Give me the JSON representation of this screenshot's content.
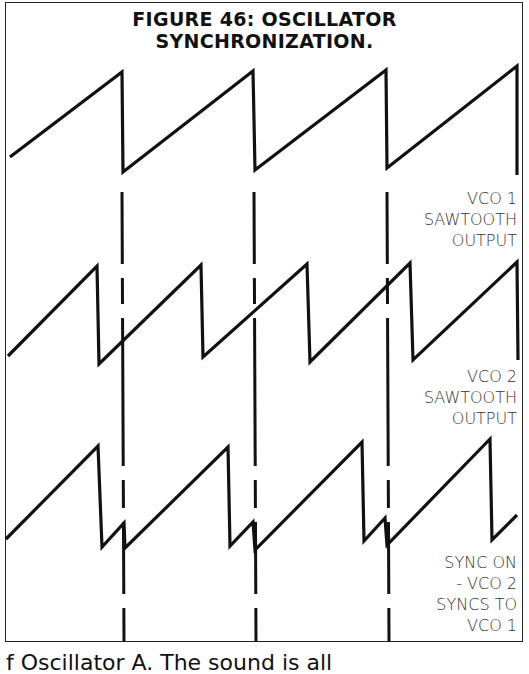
{
  "figure": {
    "title_line1": "FIGURE 46: OSCILLATOR",
    "title_line2": "SYNCHRONIZATION.",
    "labels": {
      "vco1": [
        "VCO 1",
        "SAWTOOTH",
        "OUTPUT"
      ],
      "vco2": [
        "VCO 2",
        "SAWTOOTH",
        "OUTPUT"
      ],
      "sync": [
        "SYNC ON",
        "- VCO 2",
        "SYNCS TO",
        "VCO 1"
      ]
    },
    "caption_fragment": "f Oscillator A. The sound is all"
  },
  "chart_data": {
    "type": "line",
    "title": "FIGURE 46: OSCILLATOR SYNCHRONIZATION.",
    "xlabel": "",
    "ylabel": "",
    "grid": false,
    "legend_position": "right (inline labels)",
    "series": [
      {
        "name": "VCO 1 SAWTOOTH OUTPUT",
        "points": [
          [
            10,
            157
          ],
          [
            122,
            72
          ],
          [
            123,
            172
          ],
          [
            253,
            71
          ],
          [
            255,
            170
          ],
          [
            386,
            70
          ],
          [
            387,
            168
          ],
          [
            517,
            66
          ],
          [
            517,
            175
          ]
        ]
      },
      {
        "name": "VCO 2 SAWTOOTH OUTPUT",
        "points": [
          [
            8,
            356
          ],
          [
            97,
            266
          ],
          [
            99,
            364
          ],
          [
            201,
            265
          ],
          [
            203,
            357
          ],
          [
            307,
            264
          ],
          [
            310,
            362
          ],
          [
            410,
            263
          ],
          [
            413,
            360
          ],
          [
            517,
            262
          ],
          [
            518,
            360
          ]
        ]
      },
      {
        "name": "SYNC ON - VCO 2 SYNCS TO VCO 1",
        "points": [
          [
            6,
            539
          ],
          [
            98,
            446
          ],
          [
            102,
            547
          ],
          [
            124,
            523
          ],
          [
            125,
            548
          ],
          [
            228,
            447
          ],
          [
            230,
            546
          ],
          [
            253,
            522
          ],
          [
            255,
            550
          ],
          [
            362,
            442
          ],
          [
            364,
            541
          ],
          [
            385,
            518
          ],
          [
            387,
            545
          ],
          [
            490,
            439
          ],
          [
            492,
            540
          ],
          [
            517,
            515
          ]
        ]
      }
    ],
    "sync_markers_x": [
      122,
      254,
      387
    ]
  }
}
